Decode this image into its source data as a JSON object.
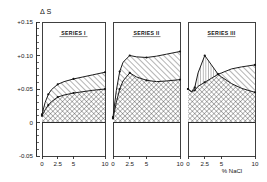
{
  "figure": {
    "y_axis_title": "Δ S",
    "x_axis_title": "% NaCl"
  },
  "chart_data": {
    "type": "area",
    "title": "Δ S",
    "xlabel": "% NaCl",
    "ylabel": "Δ S",
    "xlim": [
      0,
      10
    ],
    "ylim": [
      -0.05,
      0.15
    ],
    "grid": false,
    "legend": "none",
    "x_ticks": [
      "0",
      "2.5",
      "5",
      "10"
    ],
    "x_tick_values": [
      0,
      2.5,
      5,
      10
    ],
    "y_ticks": [
      "+0.15",
      "+0.10",
      "+0.05",
      "0",
      "-0.05"
    ],
    "y_tick_values": [
      0.15,
      0.1,
      0.05,
      0,
      -0.05
    ],
    "panels": [
      {
        "title": "SERIES I",
        "x": [
          0,
          0.5,
          1,
          1.5,
          2.5,
          3.5,
          5,
          6.5,
          8,
          10
        ],
        "series": [
          {
            "name": "upper",
            "hatch": "diagonal",
            "values": [
              0.012,
              0.03,
              0.042,
              0.049,
              0.057,
              0.061,
              0.065,
              0.068,
              0.071,
              0.075
            ]
          },
          {
            "name": "lower",
            "hatch": "cross",
            "values": [
              0.01,
              0.019,
              0.026,
              0.031,
              0.038,
              0.041,
              0.044,
              0.046,
              0.048,
              0.05
            ]
          }
        ]
      },
      {
        "title": "SERIES II",
        "x": [
          0,
          0.5,
          1,
          1.5,
          2.5,
          3.5,
          5,
          6.5,
          8,
          10
        ],
        "series": [
          {
            "name": "upper",
            "hatch": "diagonal",
            "values": [
              0.008,
              0.048,
              0.076,
              0.09,
              0.1,
              0.098,
              0.097,
              0.099,
              0.102,
              0.106
            ]
          },
          {
            "name": "lower",
            "hatch": "cross",
            "values": [
              0.006,
              0.03,
              0.05,
              0.062,
              0.074,
              0.068,
              0.063,
              0.061,
              0.062,
              0.064
            ]
          }
        ]
      },
      {
        "title": "SERIES III",
        "x": [
          0,
          0.5,
          1,
          1.5,
          2.5,
          3.5,
          4.5,
          5,
          6.5,
          8,
          10
        ],
        "series": [
          {
            "name": "peaked",
            "hatch": "vertical",
            "values": [
              0.05,
              0.046,
              0.052,
              0.074,
              0.1,
              0.086,
              0.072,
              0.068,
              0.058,
              0.051,
              0.045
            ]
          },
          {
            "name": "rising",
            "hatch": "diagonal",
            "values": [
              0.05,
              0.046,
              0.048,
              0.054,
              0.06,
              0.066,
              0.072,
              0.074,
              0.08,
              0.083,
              0.086
            ]
          }
        ]
      }
    ]
  }
}
